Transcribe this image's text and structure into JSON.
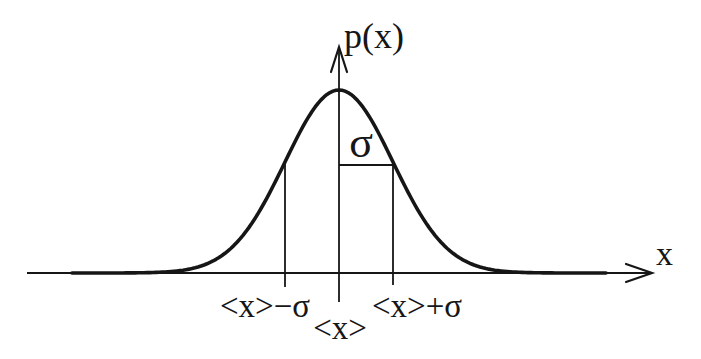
{
  "figure": {
    "curve": {
      "type": "gaussian",
      "distribution": "p(x)",
      "mean_label": "<x>",
      "std_label": "σ",
      "marked_points": [
        "<x>−σ",
        "<x>",
        "<x>+σ"
      ]
    },
    "labels": {
      "y_axis": "p(x)",
      "x_axis": "x",
      "sigma": "σ",
      "mean": "<x>",
      "mean_minus_sigma": "<x>−σ",
      "mean_plus_sigma": "<x>+σ"
    },
    "colors": {
      "ink": "#161616",
      "background": "#ffffff"
    }
  }
}
